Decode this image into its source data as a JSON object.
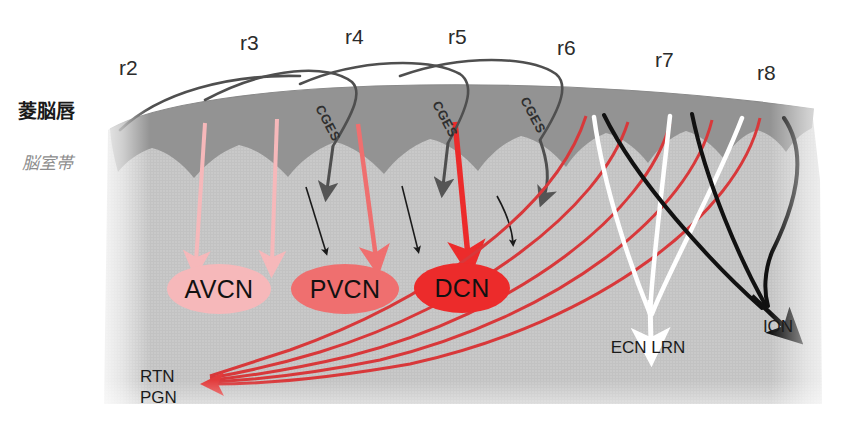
{
  "figure": {
    "background_color": "#ffffff",
    "tissue_color": "#c9c9c9",
    "rhombic_lip_color": "#939393",
    "canvas": {
      "width": 853,
      "height": 429
    }
  },
  "zones": [
    {
      "id": "rhombic-lip",
      "label": "菱脳唇",
      "label_x": 18,
      "label_y": 118,
      "style": "bold",
      "color": "#1a1a1a"
    },
    {
      "id": "ventricular-zone",
      "label": "脳室帯",
      "label_x": 22,
      "label_y": 169,
      "style": "italic",
      "color": "#8d8d8d"
    }
  ],
  "rhombomeres": [
    {
      "id": "r2",
      "label": "r2",
      "x": 119,
      "y": 75
    },
    {
      "id": "r3",
      "label": "r3",
      "x": 240,
      "y": 50
    },
    {
      "id": "r4",
      "label": "r4",
      "x": 345,
      "y": 44
    },
    {
      "id": "r5",
      "label": "r5",
      "x": 448,
      "y": 44
    },
    {
      "id": "r6",
      "label": "r6",
      "x": 557,
      "y": 55
    },
    {
      "id": "r7",
      "label": "r7",
      "x": 655,
      "y": 67
    },
    {
      "id": "r8",
      "label": "r8",
      "x": 757,
      "y": 80
    }
  ],
  "nuclei": [
    {
      "id": "avcn",
      "label": "AVCN",
      "cx": 219,
      "cy": 289,
      "rx": 52,
      "ry": 25,
      "fill": "#f6b8ba",
      "text_color": "#111111"
    },
    {
      "id": "pvcn",
      "label": "PVCN",
      "cx": 345,
      "cy": 289,
      "rx": 54,
      "ry": 25,
      "fill": "#ef6f6f",
      "text_color": "#111111"
    },
    {
      "id": "dcn",
      "label": "DCN",
      "cx": 462,
      "cy": 288,
      "rx": 48,
      "ry": 25,
      "fill": "#ec2b2b",
      "text_color": "#111111"
    }
  ],
  "targets": [
    {
      "id": "rtn-pgn",
      "lines": [
        "RTN",
        "PGN"
      ],
      "x": 140,
      "y": 382,
      "arrow_color": "#e23b3b"
    },
    {
      "id": "ecn-lrn",
      "label": "ECN LRN",
      "x": 648,
      "y": 353,
      "arrow_color": "#ffffff"
    },
    {
      "id": "ion",
      "label": "ION",
      "x": 778,
      "y": 332,
      "arrow_color": "#111111"
    }
  ],
  "migration_streams": [
    {
      "id": "cges-r4",
      "label": "CGES",
      "x": 315,
      "y": 108,
      "rotation": 62
    },
    {
      "id": "cges-r5",
      "label": "CGES",
      "x": 435,
      "y": 105,
      "rotation": 62
    },
    {
      "id": "cges-r6",
      "label": "CGES",
      "x": 522,
      "y": 100,
      "rotation": 62
    }
  ],
  "colors": {
    "accent_red": "#e23b3b",
    "deep_red": "#ec2b2b",
    "mid_red": "#ef6f6f",
    "pale_red": "#f6b8ba",
    "dark_gray": "#555555",
    "rhombic_lip": "#939393",
    "tissue": "#c9c9c9",
    "black": "#111111",
    "white": "#ffffff"
  },
  "legend_note": {
    "red_arrows": "cochlear nucleus / RTN-PGN projections",
    "white_arrows": "ECN LRN precerebellar stream",
    "black_arrows": "ION inferior olivary stream",
    "gray_arrows": "CGES caudal migratory stream"
  }
}
